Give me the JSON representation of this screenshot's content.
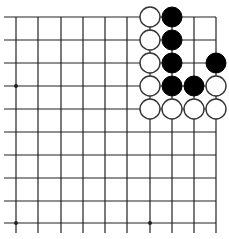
{
  "board": {
    "description": "Go board fragment (top-right corner)",
    "rows": 10,
    "cols": 10,
    "x_coords": [
      16,
      38,
      61,
      83,
      105,
      127,
      150,
      172,
      194,
      216
    ],
    "y_coords": [
      17,
      40,
      63,
      86,
      109,
      132,
      155,
      178,
      201,
      223
    ],
    "h_line_start_x": 4,
    "v_line_end_y": 233,
    "stone_radius": 10,
    "line_color": "#222222",
    "star_points": [
      [
        0,
        3
      ],
      [
        0,
        9
      ],
      [
        6,
        9
      ]
    ],
    "stones": [
      {
        "col": 6,
        "row": 0,
        "color": "white"
      },
      {
        "col": 7,
        "row": 0,
        "color": "black"
      },
      {
        "col": 6,
        "row": 1,
        "color": "white"
      },
      {
        "col": 7,
        "row": 1,
        "color": "black"
      },
      {
        "col": 6,
        "row": 2,
        "color": "white"
      },
      {
        "col": 7,
        "row": 2,
        "color": "black"
      },
      {
        "col": 9,
        "row": 2,
        "color": "black"
      },
      {
        "col": 6,
        "row": 3,
        "color": "white"
      },
      {
        "col": 7,
        "row": 3,
        "color": "black"
      },
      {
        "col": 8,
        "row": 3,
        "color": "black"
      },
      {
        "col": 9,
        "row": 3,
        "color": "white"
      },
      {
        "col": 6,
        "row": 4,
        "color": "white"
      },
      {
        "col": 7,
        "row": 4,
        "color": "white"
      },
      {
        "col": 8,
        "row": 4,
        "color": "white"
      },
      {
        "col": 9,
        "row": 4,
        "color": "white"
      }
    ]
  }
}
